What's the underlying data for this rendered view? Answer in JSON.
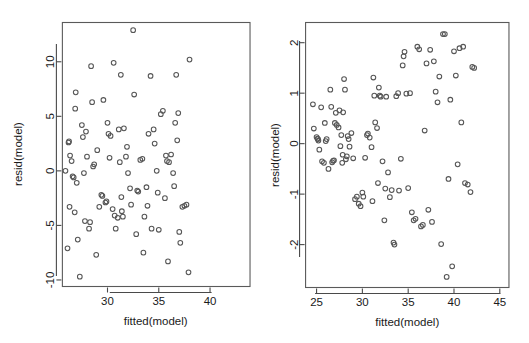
{
  "figure": {
    "background_color": "#ffffff",
    "point_color": "#565656",
    "axis_color": "#4a4a4a",
    "border_color": "#5a5a5a",
    "layout": "two side-by-side residual scatter plots (R base graphics style)"
  },
  "chart_data": [
    {
      "panel": "left",
      "type": "scatter",
      "title": "",
      "xlabel": "fitted(model)",
      "ylabel": "resid(model)",
      "xlim": [
        25.6,
        43.9
      ],
      "ylim": [
        -10.6,
        13.6
      ],
      "xticks": [
        30,
        35,
        40
      ],
      "yticks": [
        10,
        5,
        0,
        -5,
        -10
      ],
      "xtick_labels": [
        "30",
        "35",
        "40"
      ],
      "ytick_labels": [
        "10",
        "5",
        "0",
        "-5",
        "-10"
      ],
      "grid": false,
      "legend": null,
      "point_symbol": "open-circle",
      "n_points": 113,
      "x": [
        25.9,
        26.1,
        26.2,
        26.25,
        26.3,
        26.35,
        26.5,
        26.6,
        26.7,
        26.8,
        26.85,
        26.9,
        27.0,
        27.1,
        27.3,
        27.5,
        27.6,
        27.7,
        27.8,
        27.9,
        28.0,
        28.2,
        28.3,
        28.4,
        28.5,
        28.6,
        28.7,
        28.9,
        29.0,
        29.2,
        29.4,
        29.5,
        29.6,
        29.8,
        29.9,
        30.0,
        30.1,
        30.2,
        30.3,
        30.5,
        30.6,
        30.7,
        30.8,
        31.0,
        31.1,
        31.2,
        31.3,
        31.35,
        31.4,
        31.5,
        31.6,
        31.8,
        31.9,
        32.0,
        32.2,
        32.3,
        32.5,
        32.6,
        32.8,
        32.9,
        33.0,
        33.2,
        33.4,
        33.5,
        33.6,
        33.8,
        33.9,
        34.0,
        34.2,
        34.3,
        34.5,
        34.6,
        34.8,
        34.9,
        35.0,
        35.2,
        35.4,
        35.6,
        35.7,
        35.8,
        35.9,
        36.0,
        36.2,
        36.4,
        36.5,
        36.6,
        36.7,
        36.8,
        36.9,
        37.0,
        37.1,
        37.3,
        37.5,
        37.7,
        37.9,
        38.0,
        38.2,
        38.4,
        38.6,
        38.8,
        39.0,
        39.2,
        39.4,
        39.6,
        39.8,
        40.0,
        40.2,
        40.4,
        40.5,
        40.6,
        40.8,
        41.0,
        41.1,
        41.2,
        41.4,
        41.6,
        41.8,
        42.0,
        42.2,
        42.4,
        42.6,
        42.8,
        43.0,
        43.2,
        43.4,
        43.6
      ],
      "y": [
        0.0,
        -7.1,
        2.6,
        2.7,
        -3.3,
        1.4,
        0.9,
        -0.5,
        -0.6,
        -3.8,
        5.7,
        7.2,
        -1.1,
        -6.3,
        -9.7,
        4.2,
        3.1,
        -0.2,
        -4.6,
        3.6,
        1.3,
        -5.3,
        -4.7,
        9.6,
        6.3,
        0.4,
        0.6,
        -7.7,
        1.9,
        -3.3,
        -2.2,
        -2.3,
        6.5,
        -2.9,
        -2.8,
        4.4,
        3.4,
        1.2,
        3.2,
        -3.5,
        9.9,
        -4.1,
        -5.3,
        -4.3,
        3.8,
        0.8,
        8.8,
        -2.4,
        -3.7,
        -4.2,
        3.9,
        1.3,
        2.2,
        -0.2,
        -1.6,
        -3.1,
        12.9,
        7.0,
        -5.8,
        -1.8,
        -1.9,
        1.0,
        1.1,
        -7.5,
        -4.2,
        -1.5,
        -3.2,
        3.4,
        8.7,
        -5.3,
        3.8,
        2.5,
        0.0,
        -2.0,
        -5.4,
        5.2,
        5.5,
        -2.5,
        1.4,
        0.9,
        -8.3,
        0.8,
        1.5,
        -0.2,
        -1.4,
        4.4,
        8.8,
        2.8,
        5.3,
        -5.6,
        -6.6,
        -3.3,
        -3.2,
        -3.1,
        -9.3,
        10.2
      ]
    },
    {
      "panel": "right",
      "type": "scatter",
      "title": "",
      "xlabel": "fitted(model)",
      "ylabel": "resid(model)",
      "xlim": [
        23.8,
        46.0
      ],
      "ylim": [
        -2.85,
        2.4
      ],
      "xticks": [
        25,
        30,
        35,
        40,
        45
      ],
      "yticks": [
        2,
        1,
        0,
        -1,
        -2
      ],
      "xtick_labels": [
        "25",
        "30",
        "35",
        "40",
        "45"
      ],
      "ytick_labels": [
        "2",
        "1",
        "0",
        "-1",
        "-2"
      ],
      "grid": false,
      "legend": null,
      "point_symbol": "open-circle",
      "n_points": 118,
      "x": [
        24.6,
        24.7,
        25.0,
        25.1,
        25.15,
        25.2,
        25.3,
        25.5,
        25.6,
        25.8,
        25.9,
        26.0,
        26.1,
        26.3,
        26.5,
        26.6,
        26.7,
        26.8,
        26.9,
        27.0,
        27.1,
        27.2,
        27.4,
        27.5,
        27.6,
        27.7,
        27.8,
        27.85,
        27.9,
        28.0,
        28.1,
        28.2,
        28.3,
        28.4,
        28.5,
        28.6,
        28.8,
        29.0,
        29.2,
        29.4,
        29.6,
        29.8,
        30.0,
        30.1,
        30.3,
        30.5,
        30.6,
        30.8,
        31.0,
        31.1,
        31.2,
        31.3,
        31.4,
        31.6,
        31.7,
        31.8,
        31.9,
        32.0,
        32.2,
        32.4,
        32.5,
        32.6,
        32.8,
        33.0,
        33.2,
        33.4,
        33.5,
        33.7,
        33.9,
        34.0,
        34.2,
        34.4,
        34.5,
        34.6,
        34.8,
        35.0,
        35.2,
        35.4,
        35.6,
        35.8,
        36.0,
        36.2,
        36.4,
        36.6,
        36.8,
        37.0,
        37.2,
        37.4,
        37.6,
        37.8,
        38.0,
        38.2,
        38.4,
        38.6,
        38.8,
        39.0,
        39.2,
        39.4,
        39.6,
        39.8,
        40.0,
        40.2,
        40.4,
        40.6,
        40.8,
        41.0,
        41.2,
        41.5,
        41.8,
        42.0,
        42.2,
        42.4,
        42.5,
        42.7,
        42.9,
        43.2,
        43.5,
        43.8,
        44.0,
        44.2,
        44.5,
        44.8,
        45.0,
        45.1,
        45.3
      ],
      "y": [
        0.78,
        0.3,
        0.13,
        0.1,
        0.09,
        0.06,
        -0.12,
        0.72,
        -0.35,
        -0.38,
        0.41,
        0.05,
        0.09,
        -0.5,
        1.07,
        0.73,
        -0.37,
        -0.34,
        -0.33,
        0.41,
        0.61,
        0.37,
        0.32,
        0.66,
        -0.05,
        0.17,
        -0.38,
        -0.22,
        0.62,
        1.28,
        1.07,
        -0.31,
        -0.25,
        0.15,
        0.09,
        -0.06,
        0.21,
        -0.29,
        -1.1,
        -1.05,
        -1.19,
        -1.24,
        -0.97,
        -1.05,
        -0.28,
        0.17,
        0.2,
        0.12,
        -0.07,
        -1.14,
        1.31,
        0.95,
        0.42,
        0.31,
        -0.78,
        1.11,
        0.95,
        0.93,
        -0.35,
        -1.52,
        -0.89,
        0.93,
        -0.57,
        -1.06,
        -0.92,
        -1.96,
        -2.0,
        0.94,
        1.0,
        -0.93,
        -0.3,
        1.55,
        1.73,
        1.82,
        0.99,
        -0.88,
        1.0,
        -1.36,
        -1.52,
        -1.49,
        1.92,
        1.87,
        -1.64,
        -1.61,
        0.26,
        1.59,
        -1.31,
        1.86,
        -1.55,
        1.63,
        1.03,
        0.82,
        1.33,
        -1.99,
        2.17,
        2.17,
        -2.64,
        -0.7,
        0.87,
        -2.43,
        1.83,
        1.35,
        -0.41,
        1.89,
        0.42,
        1.92,
        -0.78,
        -0.81,
        -0.96,
        1.52,
        1.5
      ],
      "note": "residual vs fitted plot showing mild funnel / downward band structure"
    }
  ]
}
